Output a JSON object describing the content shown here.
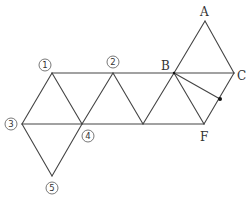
{
  "diagram": {
    "type": "geometry-net",
    "labels": {
      "A": "A",
      "B": "B",
      "C": "C",
      "F": "F",
      "n1": "1",
      "n2": "2",
      "n3": "3",
      "n4": "4",
      "n5": "5"
    },
    "colors": {
      "line": "#444444",
      "text": "#333333",
      "background": "#ffffff"
    },
    "points": {
      "A": [
        205,
        21
      ],
      "B": [
        174,
        73
      ],
      "C": [
        234,
        73
      ],
      "F": [
        204,
        124
      ],
      "P1": [
        52,
        73
      ],
      "P2": [
        113,
        73
      ],
      "P3": [
        22,
        124
      ],
      "P4": [
        82,
        124
      ],
      "P5": [
        52,
        176
      ],
      "M": [
        143,
        124
      ],
      "dot": [
        220,
        99
      ]
    }
  }
}
